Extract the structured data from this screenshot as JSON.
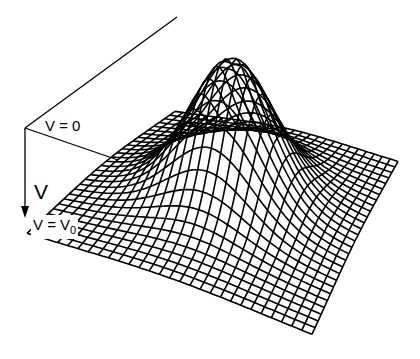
{
  "figure": {
    "type": "3d-wireframe-surface",
    "colors": {
      "line": "#000000",
      "background": "#ffffff"
    }
  },
  "labels": {
    "top_level": "V = 0",
    "axis": "V",
    "bottom_level_base": "V = V",
    "bottom_level_sub": "0"
  },
  "mesh": {
    "grid_lines": 28,
    "corners": {
      "back": [
        175,
        116
      ],
      "right": [
        398,
        166
      ],
      "front": [
        312,
        338
      ],
      "left": [
        27,
        237
      ]
    },
    "peak_height_px": 150,
    "peak_width": 0.2
  },
  "guides": {
    "vertex": [
      25,
      128
    ],
    "upper_line_end": [
      177,
      17
    ],
    "lower_line_end": [
      118,
      160
    ],
    "arrow_end": [
      25,
      218
    ]
  }
}
